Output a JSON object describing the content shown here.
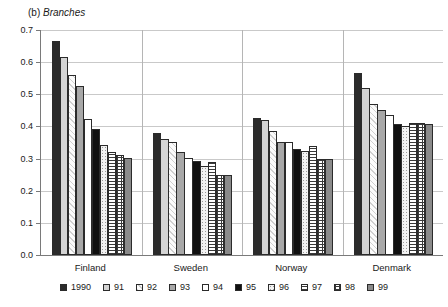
{
  "chart_data": {
    "type": "bar",
    "title": "(b) Branches",
    "title_prefix": "(b) ",
    "title_italic": "Branches",
    "xlabel": "",
    "ylabel": "",
    "ylim": [
      0.0,
      0.7
    ],
    "ytick_step": 0.1,
    "grid": true,
    "legend_position": "bottom",
    "categories": [
      "Finland",
      "Sweden",
      "Norway",
      "Denmark"
    ],
    "yticks": [
      "0.0",
      "0.1",
      "0.2",
      "0.3",
      "0.4",
      "0.5",
      "0.6",
      "0.7"
    ],
    "series": [
      {
        "name": "1990",
        "fill": "solid-dark",
        "values": [
          0.665,
          0.38,
          0.425,
          0.565
        ]
      },
      {
        "name": "91",
        "fill": "ltgray",
        "values": [
          0.615,
          0.362,
          0.42,
          0.52
        ]
      },
      {
        "name": "92",
        "fill": "hatch-lt",
        "values": [
          0.56,
          0.352,
          0.385,
          0.47
        ]
      },
      {
        "name": "93",
        "fill": "midgray",
        "values": [
          0.525,
          0.322,
          0.352,
          0.452
        ]
      },
      {
        "name": "94",
        "fill": "white",
        "values": [
          0.422,
          0.302,
          0.352,
          0.435
        ]
      },
      {
        "name": "95",
        "fill": "black",
        "values": [
          0.392,
          0.292,
          0.33,
          0.408
        ]
      },
      {
        "name": "96",
        "fill": "dots",
        "values": [
          0.342,
          0.278,
          0.325,
          0.4
        ]
      },
      {
        "name": "97",
        "fill": "hlines",
        "values": [
          0.322,
          0.288,
          0.34,
          0.412
        ]
      },
      {
        "name": "98",
        "fill": "grid",
        "values": [
          0.31,
          0.25,
          0.298,
          0.412
        ]
      },
      {
        "name": "99",
        "fill": "dkgray",
        "values": [
          0.302,
          0.25,
          0.298,
          0.408
        ]
      }
    ]
  }
}
